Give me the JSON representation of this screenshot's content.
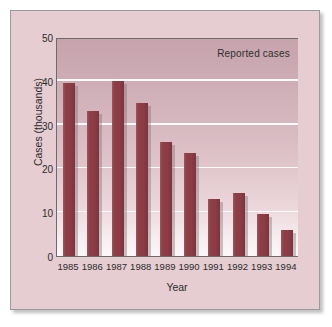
{
  "chart_data": {
    "type": "bar",
    "title": "",
    "subtitle": "",
    "xlabel": "Year",
    "ylabel": "Cases (thousands)",
    "categories": [
      "1985",
      "1986",
      "1987",
      "1988",
      "1989",
      "1990",
      "1991",
      "1992",
      "1993",
      "1994"
    ],
    "values": [
      39.5,
      33,
      40,
      35,
      26,
      23.5,
      13,
      14.5,
      9.5,
      6
    ],
    "series": [
      {
        "name": "Reported cases",
        "values": [
          39.5,
          33,
          40,
          35,
          26,
          23.5,
          13,
          14.5,
          9.5,
          6
        ]
      }
    ],
    "annotations": [
      "Reported cases"
    ],
    "ylim": [
      0,
      50
    ],
    "yticks": [
      0,
      10,
      20,
      30,
      40,
      50
    ],
    "ytick_labels": [
      "0",
      "10",
      "20",
      "30",
      "40",
      "50"
    ],
    "gridlines": "horizontal",
    "legend_position": "none",
    "bar_color": "#8b3c44",
    "plot_bg_top": "#c6a3ad",
    "plot_bg_bottom": "#fbf7f8",
    "figure_bg": "#e6cdd2",
    "gridline_color": "#fdfbfb",
    "axis_color": "#6b6b6b"
  }
}
